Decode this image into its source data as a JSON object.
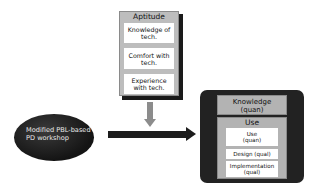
{
  "aptitude": {
    "title": "Aptitude",
    "items": [
      {
        "line1": "Knowledge of",
        "line2": "tech."
      },
      {
        "line1": "Comfort with",
        "line2": "tech."
      },
      {
        "line1": "Experience",
        "line2": "with tech."
      }
    ]
  },
  "workshop": {
    "line1": "Modified PBL-based",
    "line2": "PD workshop"
  },
  "outcomes": {
    "knowledge": {
      "line1": "Knowledge",
      "line2": "(quan)"
    },
    "use": {
      "title": "Use",
      "items": [
        {
          "line1": "Use",
          "line2": "(quan)"
        },
        {
          "line1": "Design (qual)",
          "line2": ""
        },
        {
          "line1": "Implementation",
          "line2": "(qual)"
        }
      ]
    }
  },
  "colors": {
    "box_gray": "#bdbdbd",
    "dark": "#1c1c1c",
    "arrow_gray": "#8c8c8c",
    "white": "#ffffff"
  }
}
